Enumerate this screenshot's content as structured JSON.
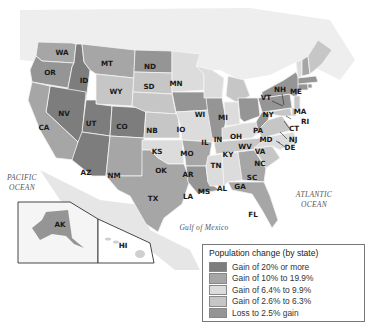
{
  "map": {
    "title": "Population change by state",
    "oceans": {
      "pacific_line1": "PACIFIC",
      "pacific_line2": "OCEAN",
      "atlantic_line1": "ATLANTIC",
      "atlantic_line2": "OCEAN",
      "gulf": "Gulf of Mexico"
    },
    "states": {
      "WA": "WA",
      "OR": "OR",
      "ID": "ID",
      "MT": "MT",
      "WY": "WY",
      "NV": "NV",
      "CA": "CA",
      "UT": "UT",
      "CO": "CO",
      "AZ": "AZ",
      "NM": "NM",
      "ND": "ND",
      "SD": "SD",
      "NB": "NB",
      "KS": "KS",
      "OK": "OK",
      "TX": "TX",
      "MN": "MN",
      "IO": "IO",
      "MO": "MO",
      "AR": "AR",
      "LA": "LA",
      "WI": "WI",
      "IL": "IL",
      "MI": "MI",
      "IN": "IN",
      "OH": "OH",
      "KY": "KY",
      "TN": "TN",
      "MS": "MS",
      "AL": "AL",
      "GA": "GA",
      "FL": "FL",
      "SC": "SC",
      "NC": "NC",
      "VA": "VA",
      "WV": "WV",
      "PA": "PA",
      "NY": "NY",
      "VT": "VT",
      "NH": "NH",
      "ME": "ME",
      "MA": "MA",
      "RI": "RI",
      "CT": "CT",
      "NJ": "NJ",
      "DE": "DE",
      "MD": "MD",
      "AK": "AK",
      "HI": "HI"
    },
    "colors": {
      "tier1": "#7d7d7d",
      "tier2": "#a6a6a6",
      "tier3": "#dcdcdc",
      "tier4": "#c6c6c6",
      "tier5": "#959595",
      "land": "#ececec",
      "water": "#ffffff"
    }
  },
  "legend": {
    "title": "Population change (by state)",
    "items": [
      {
        "label": "Gain of 20% or more",
        "color": "#7d7d7d"
      },
      {
        "label": "Gain of 10% to 19.9%",
        "color": "#a6a6a6"
      },
      {
        "label": "Gain of 6.4% to 9.9%",
        "color": "#dcdcdc"
      },
      {
        "label": "Gain of 2.6% to 6.3%",
        "color": "#c6c6c6"
      },
      {
        "label": "Loss to 2.5% gain",
        "color": "#959595"
      }
    ]
  }
}
